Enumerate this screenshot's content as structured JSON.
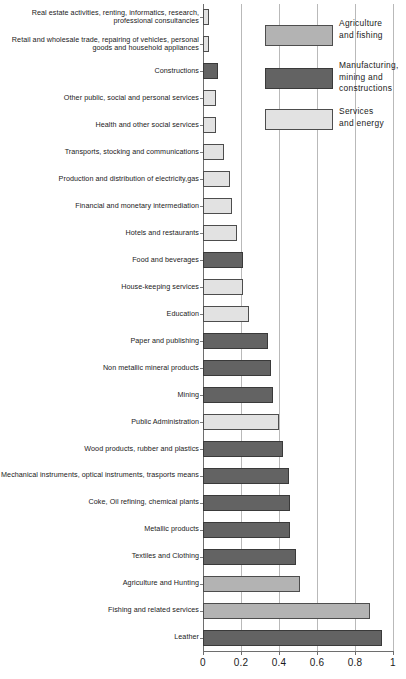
{
  "chart_data": {
    "type": "bar",
    "orientation": "horizontal",
    "title": "",
    "xlabel": "",
    "ylabel": "",
    "xlim": [
      0,
      1
    ],
    "grid": true,
    "gridlines_x": [
      0.2,
      0.4,
      0.6,
      0.8,
      1
    ],
    "xticks": [
      0,
      0.2,
      0.4,
      0.6,
      0.8,
      1
    ],
    "xtick_labels": [
      "0",
      "0.2",
      "0.4",
      "0.6",
      "0.8",
      "1"
    ],
    "legend_position": "top-right",
    "categories": [
      "Real estate activities, renting, informatics, research, professional consultancies",
      "Retail and wholesale trade, repairing of vehicles, personal goods and household appliances",
      "Constructions",
      "Other public, social and personal services",
      "Health and other social services",
      "Transports, stocking and communications",
      "Production and distribution of electricity,gas",
      "Financial and monetary intermediation",
      "Hotels and restaurants",
      "Food and beverages",
      "House-keeping services",
      "Education",
      "Paper and publishing",
      "Non metallic mineral products",
      "Mining",
      "Public Administration",
      "Wood products, rubber and plastics",
      "Mechanical instruments, optical instruments, trasports means",
      "Coke, Oil refining, chemical plants",
      "Metallic products",
      "Textiles and Clothing",
      "Agriculture and Hunting",
      "Fishing and related services",
      "Leather"
    ],
    "values": [
      0.03,
      0.03,
      0.08,
      0.07,
      0.07,
      0.11,
      0.14,
      0.15,
      0.18,
      0.21,
      0.21,
      0.24,
      0.34,
      0.36,
      0.37,
      0.4,
      0.42,
      0.45,
      0.46,
      0.46,
      0.49,
      0.51,
      0.88,
      0.94
    ],
    "sectors": [
      "services",
      "services",
      "manufacturing",
      "services",
      "services",
      "services",
      "services",
      "services",
      "services",
      "manufacturing",
      "services",
      "services",
      "manufacturing",
      "manufacturing",
      "manufacturing",
      "services",
      "manufacturing",
      "manufacturing",
      "manufacturing",
      "manufacturing",
      "manufacturing",
      "agriculture",
      "agriculture",
      "manufacturing"
    ]
  },
  "legend": {
    "items": [
      {
        "label": "Agriculture\nand fishing",
        "sector": "agriculture",
        "color": "#b3b3b3"
      },
      {
        "label": "Manufacturing,\nmining and\nconstructions",
        "sector": "manufacturing",
        "color": "#636363"
      },
      {
        "label": "Services\nand energy",
        "sector": "services",
        "color": "#e2e2e2"
      }
    ]
  },
  "colors": {
    "agriculture": "#b3b3b3",
    "manufacturing": "#636363",
    "services": "#e2e2e2",
    "gridline": "#b9b9b9",
    "axis": "#6e6e6e",
    "text": "#1a1a1a"
  }
}
